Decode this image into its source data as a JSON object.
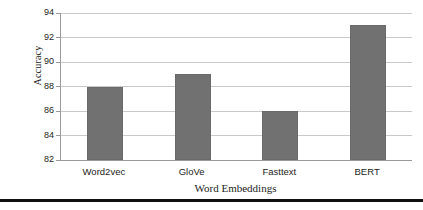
{
  "chart_data": {
    "type": "bar",
    "title": "",
    "subtitle": "",
    "xlabel": "Word Embeddings",
    "ylabel": "Accuracy",
    "categories": [
      "Word2vec",
      "GloVe",
      "Fasttext",
      "BERT"
    ],
    "values": [
      88,
      89,
      86,
      93
    ],
    "ylim": [
      82,
      94
    ],
    "ytick_labels": [
      "82",
      "84",
      "86",
      "88",
      "90",
      "92",
      "94"
    ],
    "ytick_values": [
      82,
      84,
      86,
      88,
      90,
      92,
      94
    ],
    "grid": "horizontal",
    "legend": "none",
    "bar_color": "#717171",
    "gridline_color": "#c9c9c9",
    "axis_color": "#9a9a9a",
    "background": "#ffffff",
    "annotations": []
  },
  "figure": {
    "bottom_rule_color": "#111111"
  }
}
